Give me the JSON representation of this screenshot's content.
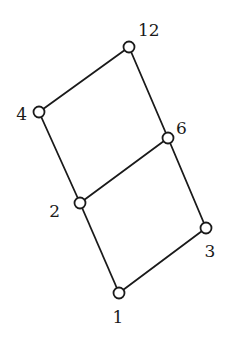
{
  "diagram": {
    "type": "hasse-diagram",
    "nodes": [
      {
        "id": "1",
        "label": "1",
        "x": 119,
        "y": 293,
        "lx": 118,
        "ly": 323,
        "anchor": "middle"
      },
      {
        "id": "2",
        "label": "2",
        "x": 80,
        "y": 203,
        "lx": 60,
        "ly": 217,
        "anchor": "end"
      },
      {
        "id": "3",
        "label": "3",
        "x": 206,
        "y": 228,
        "lx": 210,
        "ly": 257,
        "anchor": "middle"
      },
      {
        "id": "4",
        "label": "4",
        "x": 39,
        "y": 112,
        "lx": 27,
        "ly": 120,
        "anchor": "end"
      },
      {
        "id": "6",
        "label": "6",
        "x": 168,
        "y": 138,
        "lx": 176,
        "ly": 134,
        "anchor": "start"
      },
      {
        "id": "12",
        "label": "12",
        "x": 129,
        "y": 47,
        "lx": 138,
        "ly": 36,
        "anchor": "start"
      }
    ],
    "edges": [
      {
        "from": "1",
        "to": "2"
      },
      {
        "from": "1",
        "to": "3"
      },
      {
        "from": "2",
        "to": "4"
      },
      {
        "from": "2",
        "to": "6"
      },
      {
        "from": "3",
        "to": "6"
      },
      {
        "from": "4",
        "to": "12"
      },
      {
        "from": "6",
        "to": "12"
      }
    ],
    "node_radius": 5.5,
    "colors": {
      "stroke": "#1a1a1a",
      "fill": "#ffffff",
      "background": "#ffffff"
    }
  }
}
